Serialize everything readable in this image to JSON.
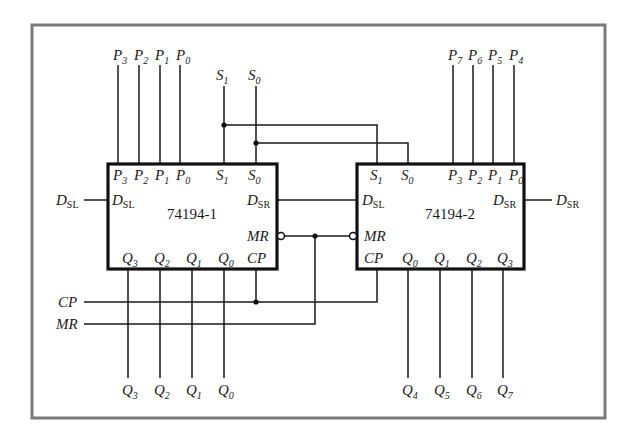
{
  "diagram": {
    "frame_color": "#7a7a7a",
    "chips": [
      {
        "name": "74194-1",
        "top_pins": [
          {
            "base": "P",
            "sub": "3"
          },
          {
            "base": "P",
            "sub": "2"
          },
          {
            "base": "P",
            "sub": "1"
          },
          {
            "base": "P",
            "sub": "0"
          },
          {
            "base": "S",
            "sub": "1"
          },
          {
            "base": "S",
            "sub": "0"
          }
        ],
        "left_pins": [
          {
            "base": "D",
            "sub": "SL"
          }
        ],
        "right_pins": [
          {
            "base": "D",
            "sub": "SR"
          },
          {
            "base": "MR",
            "sub": ""
          },
          {
            "base": "CP",
            "sub": ""
          }
        ],
        "bottom_pins": [
          {
            "base": "Q",
            "sub": "3"
          },
          {
            "base": "Q",
            "sub": "2"
          },
          {
            "base": "Q",
            "sub": "1"
          },
          {
            "base": "Q",
            "sub": "0"
          }
        ]
      },
      {
        "name": "74194-2",
        "top_pins": [
          {
            "base": "S",
            "sub": "1"
          },
          {
            "base": "S",
            "sub": "0"
          },
          {
            "base": "P",
            "sub": "3"
          },
          {
            "base": "P",
            "sub": "2"
          },
          {
            "base": "P",
            "sub": "1"
          },
          {
            "base": "P",
            "sub": "0"
          }
        ],
        "left_pins": [
          {
            "base": "D",
            "sub": "SL"
          },
          {
            "base": "MR",
            "sub": ""
          },
          {
            "base": "CP",
            "sub": ""
          }
        ],
        "right_pins": [
          {
            "base": "D",
            "sub": "SR"
          }
        ],
        "bottom_pins": [
          {
            "base": "Q",
            "sub": "0"
          },
          {
            "base": "Q",
            "sub": "1"
          },
          {
            "base": "Q",
            "sub": "2"
          },
          {
            "base": "Q",
            "sub": "3"
          }
        ]
      }
    ],
    "external_signals": {
      "inputs_top_left": [
        {
          "base": "P",
          "sub": "3"
        },
        {
          "base": "P",
          "sub": "2"
        },
        {
          "base": "P",
          "sub": "1"
        },
        {
          "base": "P",
          "sub": "0"
        }
      ],
      "inputs_select": [
        {
          "base": "S",
          "sub": "1"
        },
        {
          "base": "S",
          "sub": "0"
        }
      ],
      "inputs_top_right": [
        {
          "base": "P",
          "sub": "7"
        },
        {
          "base": "P",
          "sub": "6"
        },
        {
          "base": "P",
          "sub": "5"
        },
        {
          "base": "P",
          "sub": "4"
        }
      ],
      "serial_in_left": {
        "base": "D",
        "sub": "SL"
      },
      "serial_in_right": {
        "base": "D",
        "sub": "SR"
      },
      "clock": {
        "base": "CP",
        "sub": ""
      },
      "master_reset": {
        "base": "MR",
        "sub": ""
      },
      "outputs_left": [
        {
          "base": "Q",
          "sub": "3"
        },
        {
          "base": "Q",
          "sub": "2"
        },
        {
          "base": "Q",
          "sub": "1"
        },
        {
          "base": "Q",
          "sub": "0"
        }
      ],
      "outputs_right": [
        {
          "base": "Q",
          "sub": "4"
        },
        {
          "base": "Q",
          "sub": "5"
        },
        {
          "base": "Q",
          "sub": "6"
        },
        {
          "base": "Q",
          "sub": "7"
        }
      ]
    }
  }
}
